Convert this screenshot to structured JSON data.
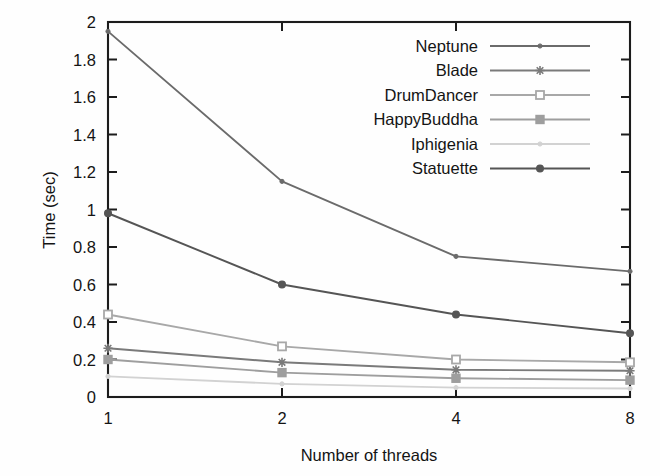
{
  "chart_data": {
    "type": "line",
    "title": "",
    "xlabel": "Number of threads",
    "ylabel": "Time (sec)",
    "x": [
      1,
      2,
      4,
      8
    ],
    "xtick_labels": [
      "1",
      "2",
      "4",
      "8"
    ],
    "xscale": "log2",
    "xlim": [
      1,
      8
    ],
    "ylim": [
      0,
      2
    ],
    "ytick_labels": [
      "0",
      "0.2",
      "0.4",
      "0.6",
      "0.8",
      "1",
      "1.2",
      "1.4",
      "1.6",
      "1.8",
      "2"
    ],
    "ytick_values": [
      0,
      0.2,
      0.4,
      0.6,
      0.8,
      1,
      1.2,
      1.4,
      1.6,
      1.8,
      2
    ],
    "grid": false,
    "legend_position": "top-right",
    "series": [
      {
        "name": "Neptune",
        "values": [
          1.95,
          1.15,
          0.75,
          0.67
        ],
        "color": "#6b6b6b",
        "marker": "dot"
      },
      {
        "name": "Blade",
        "values": [
          0.26,
          0.185,
          0.145,
          0.14
        ],
        "color": "#7a7a7a",
        "marker": "star"
      },
      {
        "name": "DrumDancer",
        "values": [
          0.44,
          0.27,
          0.2,
          0.185
        ],
        "color": "#a8a8a8",
        "marker": "square-open"
      },
      {
        "name": "HappyBuddha",
        "values": [
          0.2,
          0.13,
          0.1,
          0.09
        ],
        "color": "#9e9e9e",
        "marker": "square-filled"
      },
      {
        "name": "Iphigenia",
        "values": [
          0.11,
          0.07,
          0.05,
          0.045
        ],
        "color": "#d2d2d2",
        "marker": "dot"
      },
      {
        "name": "Statuette",
        "values": [
          0.98,
          0.6,
          0.44,
          0.34
        ],
        "color": "#555555",
        "marker": "circle-filled"
      }
    ]
  },
  "axes": {
    "y_title": "Time (sec)",
    "x_title": "Number of threads"
  },
  "legend": {
    "entries": [
      {
        "label": "Neptune"
      },
      {
        "label": "Blade"
      },
      {
        "label": "DrumDancer"
      },
      {
        "label": "HappyBuddha"
      },
      {
        "label": "Iphigenia"
      },
      {
        "label": "Statuette"
      }
    ]
  }
}
